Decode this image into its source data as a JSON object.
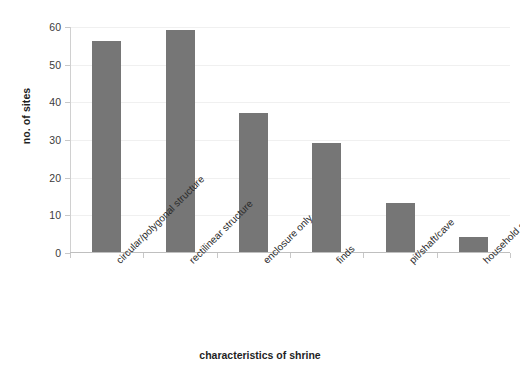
{
  "chart_data": {
    "type": "bar",
    "title": "",
    "xlabel": "characteristics of shrine",
    "ylabel": "no. of sites",
    "categories": [
      "circular/polygonal structure",
      "rectilinear structure",
      "enclosure only",
      "finds",
      "pit/shaft/cave",
      "household shrine"
    ],
    "values": [
      56,
      59,
      37,
      29,
      13,
      4
    ],
    "ylim": [
      0,
      60
    ],
    "ytick_labels": [
      "0",
      "10",
      "20",
      "30",
      "40",
      "50",
      "60"
    ],
    "ytick_values": [
      0,
      10,
      20,
      30,
      40,
      50,
      60
    ],
    "grid": true,
    "legend": false,
    "bar_color": "#767676",
    "axis_color": "#c8c8c8",
    "gridline_color": "#f0f0f0",
    "background_color": "#ffffff"
  }
}
